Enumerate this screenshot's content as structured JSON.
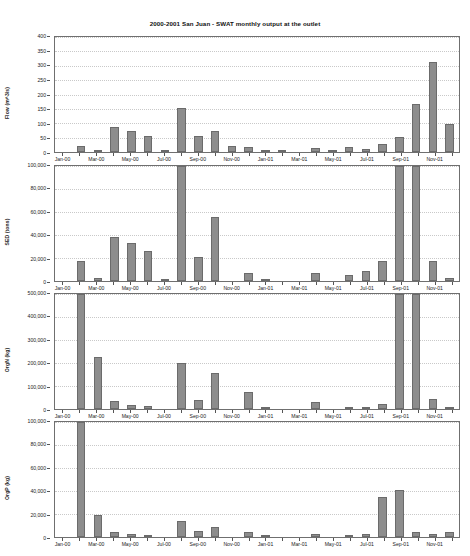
{
  "title": "2000-2001 San Juan - SWAT monthly output at the outlet",
  "x_tick_labels": [
    "Jan-00",
    "Mar-00",
    "May-00",
    "Jul-00",
    "Sep-00",
    "Nov-00",
    "Jan-01",
    "Mar-01",
    "May-01",
    "Jul-01",
    "Sep-01",
    "Nov-01"
  ],
  "months": [
    "Jan-00",
    "Feb-00",
    "Mar-00",
    "Apr-00",
    "May-00",
    "Jun-00",
    "Jul-00",
    "Aug-00",
    "Sep-00",
    "Oct-00",
    "Nov-00",
    "Dec-00",
    "Jan-01",
    "Feb-01",
    "Mar-01",
    "Apr-01",
    "May-01",
    "Jun-01",
    "Jul-01",
    "Aug-01",
    "Sep-01",
    "Oct-01",
    "Nov-01",
    "Dec-01"
  ],
  "chart_data": [
    {
      "type": "bar",
      "title": "2000-2001 San Juan - SWAT monthly output at the outlet",
      "ylabel": "Flow (m^3/s)",
      "xlabel": "",
      "ylim": [
        0,
        400
      ],
      "yticks": [
        0,
        50,
        100,
        150,
        200,
        250,
        300,
        350,
        400
      ],
      "ytick_labels": [
        "0",
        "50",
        "100",
        "150",
        "200",
        "250",
        "300",
        "350",
        "400"
      ],
      "grid": true,
      "categories": [
        "Jan-00",
        "Feb-00",
        "Mar-00",
        "Apr-00",
        "May-00",
        "Jun-00",
        "Jul-00",
        "Aug-00",
        "Sep-00",
        "Oct-00",
        "Nov-00",
        "Dec-00",
        "Jan-01",
        "Feb-01",
        "Mar-01",
        "Apr-01",
        "May-01",
        "Jun-01",
        "Jul-01",
        "Aug-01",
        "Sep-01",
        "Oct-01",
        "Nov-01",
        "Dec-01"
      ],
      "values": [
        0,
        22,
        8,
        88,
        72,
        54,
        3,
        152,
        55,
        72,
        20,
        18,
        4,
        2,
        0,
        14,
        8,
        18,
        12,
        28,
        52,
        168,
        312,
        96
      ]
    },
    {
      "type": "bar",
      "ylabel": "SED (tons)",
      "xlabel": "",
      "ylim": [
        0,
        100000
      ],
      "yticks": [
        0,
        20000,
        40000,
        60000,
        80000,
        100000
      ],
      "ytick_labels": [
        "0",
        "20,000",
        "40,000",
        "60,000",
        "80,000",
        "100,000"
      ],
      "grid": true,
      "categories": [
        "Jan-00",
        "Feb-00",
        "Mar-00",
        "Apr-00",
        "May-00",
        "Jun-00",
        "Jul-00",
        "Aug-00",
        "Sep-00",
        "Oct-00",
        "Nov-00",
        "Dec-00",
        "Jan-01",
        "Feb-01",
        "Mar-01",
        "Apr-01",
        "May-01",
        "Jun-01",
        "Jul-01",
        "Aug-01",
        "Sep-01",
        "Oct-01",
        "Nov-01",
        "Dec-01"
      ],
      "values": [
        0,
        17000,
        3000,
        38000,
        33000,
        26000,
        800,
        100000,
        21000,
        56000,
        0,
        7000,
        600,
        0,
        0,
        7000,
        0,
        5000,
        9000,
        17000,
        100000,
        100000,
        17000,
        3000
      ]
    },
    {
      "type": "bar",
      "ylabel": "OrgN (kg)",
      "xlabel": "",
      "ylim": [
        0,
        500000
      ],
      "yticks": [
        0,
        100000,
        200000,
        300000,
        400000,
        500000
      ],
      "ytick_labels": [
        "0",
        "100,000",
        "200,000",
        "300,000",
        "400,000",
        "500,000"
      ],
      "grid": true,
      "categories": [
        "Jan-00",
        "Feb-00",
        "Mar-00",
        "Apr-00",
        "May-00",
        "Jun-00",
        "Jul-00",
        "Aug-00",
        "Sep-00",
        "Oct-00",
        "Nov-00",
        "Dec-00",
        "Jan-01",
        "Feb-01",
        "Mar-01",
        "Apr-01",
        "May-01",
        "Jun-01",
        "Jul-01",
        "Aug-01",
        "Sep-01",
        "Oct-01",
        "Nov-01",
        "Dec-01"
      ],
      "values": [
        0,
        500000,
        228000,
        34000,
        18000,
        12000,
        0,
        198000,
        38000,
        155000,
        0,
        76000,
        4000,
        0,
        0,
        32000,
        0,
        6000,
        9000,
        22000,
        500000,
        500000,
        43000,
        5000
      ]
    },
    {
      "type": "bar",
      "ylabel": "OrgP (kg)",
      "xlabel": "",
      "ylim": [
        0,
        100000
      ],
      "yticks": [
        0,
        20000,
        40000,
        60000,
        80000,
        100000
      ],
      "ytick_labels": [
        "0",
        "20,000",
        "40,000",
        "60,000",
        "80,000",
        "100,000"
      ],
      "grid": true,
      "categories": [
        "Jan-00",
        "Feb-00",
        "Mar-00",
        "Apr-00",
        "May-00",
        "Jun-00",
        "Jul-00",
        "Aug-00",
        "Sep-00",
        "Oct-00",
        "Nov-00",
        "Dec-00",
        "Jan-01",
        "Feb-01",
        "Mar-01",
        "Apr-01",
        "May-01",
        "Jun-01",
        "Jul-01",
        "Aug-01",
        "Sep-01",
        "Oct-01",
        "Nov-01",
        "Dec-01"
      ],
      "values": [
        0,
        100000,
        19000,
        4000,
        2500,
        1500,
        0,
        14000,
        5000,
        9000,
        0,
        4500,
        500,
        0,
        0,
        2500,
        0,
        1000,
        3000,
        35000,
        41000,
        4000,
        2500,
        4500
      ]
    }
  ]
}
